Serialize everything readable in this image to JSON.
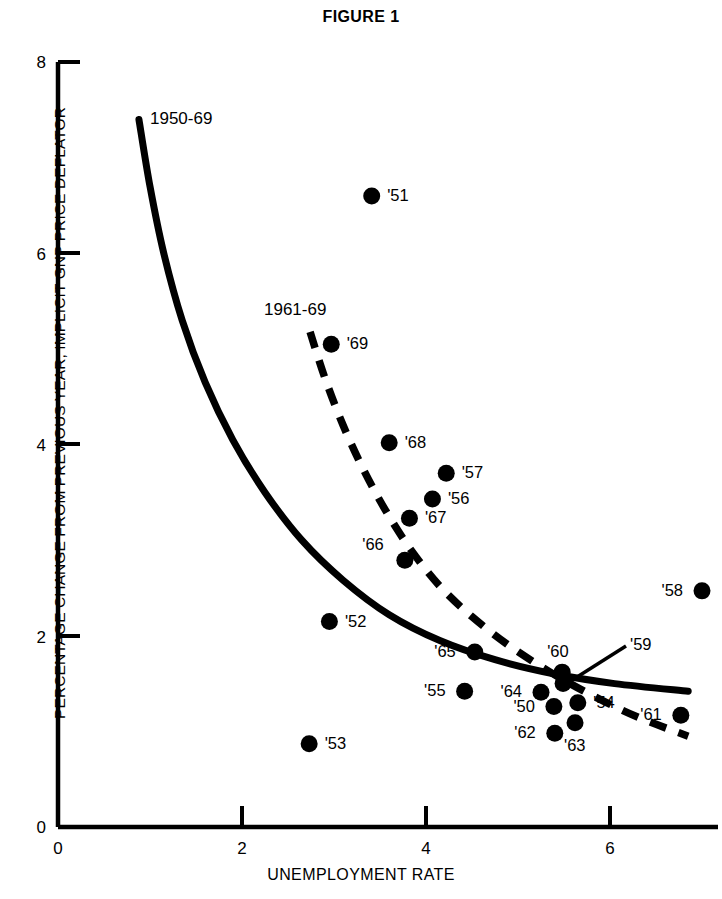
{
  "figure": {
    "title": "FIGURE 1"
  },
  "axes": {
    "xlabel": "UNEMPLOYMENT RATE",
    "ylabel": "PERCENTAGE CHANGE FROM PREVIOUS YEAR, IMPLICIT GNP PRICE DEFLATOR",
    "xticks": [
      "0",
      "2",
      "4",
      "6"
    ],
    "yticks": [
      "8",
      "6",
      "4",
      "2",
      "0"
    ]
  },
  "curves": {
    "solid_label": "1950-69",
    "dashed_label": "1961-69"
  },
  "colors": {
    "ink": "#000000",
    "background": "#ffffff"
  },
  "chart_data": {
    "type": "scatter",
    "title": "FIGURE 1",
    "xlabel": "UNEMPLOYMENT RATE",
    "ylabel": "PERCENTAGE CHANGE FROM PREVIOUS YEAR, IMPLICIT GNP PRICE DEFLATOR",
    "xlim": [
      0,
      7.2
    ],
    "ylim": [
      0,
      8
    ],
    "xticks": [
      0,
      2,
      4,
      6
    ],
    "yticks": [
      0,
      2,
      4,
      6,
      8
    ],
    "grid": false,
    "legend": "none",
    "points": [
      {
        "label": "'50",
        "x": 5.39,
        "y": 1.26,
        "label_pos": "left"
      },
      {
        "label": "'51",
        "x": 3.41,
        "y": 6.6,
        "label_pos": "right"
      },
      {
        "label": "'52",
        "x": 2.95,
        "y": 2.15,
        "label_pos": "right"
      },
      {
        "label": "'53",
        "x": 2.73,
        "y": 0.87,
        "label_pos": "right"
      },
      {
        "label": "'54",
        "x": 5.65,
        "y": 1.3,
        "label_pos": "right"
      },
      {
        "label": "'55",
        "x": 4.42,
        "y": 1.42,
        "label_pos": "left"
      },
      {
        "label": "'56",
        "x": 4.07,
        "y": 3.43,
        "label_pos": "right"
      },
      {
        "label": "'57",
        "x": 4.22,
        "y": 3.7,
        "label_pos": "right"
      },
      {
        "label": "'58",
        "x": 7.0,
        "y": 2.47,
        "label_pos": "left"
      },
      {
        "label": "'59",
        "x": 5.49,
        "y": 1.5,
        "label_pos": "leader"
      },
      {
        "label": "'60",
        "x": 5.48,
        "y": 1.62,
        "label_pos": "above"
      },
      {
        "label": "'61",
        "x": 6.77,
        "y": 1.17,
        "label_pos": "left"
      },
      {
        "label": "'62",
        "x": 5.4,
        "y": 0.98,
        "label_pos": "left"
      },
      {
        "label": "'63",
        "x": 5.62,
        "y": 1.09,
        "label_pos": "below"
      },
      {
        "label": "'64",
        "x": 5.25,
        "y": 1.41,
        "label_pos": "left"
      },
      {
        "label": "'65",
        "x": 4.53,
        "y": 1.83,
        "label_pos": "left"
      },
      {
        "label": "'66",
        "x": 3.77,
        "y": 2.79,
        "label_pos": "upper-left"
      },
      {
        "label": "'67",
        "x": 3.82,
        "y": 3.23,
        "label_pos": "right"
      },
      {
        "label": "'68",
        "x": 3.6,
        "y": 4.02,
        "label_pos": "right"
      },
      {
        "label": "'69",
        "x": 2.97,
        "y": 5.05,
        "label_pos": "right"
      }
    ],
    "series": [
      {
        "name": "1950-69",
        "style": "solid",
        "points": [
          [
            0.88,
            7.4
          ],
          [
            1.0,
            6.7
          ],
          [
            1.15,
            6.0
          ],
          [
            1.35,
            5.3
          ],
          [
            1.6,
            4.65
          ],
          [
            1.9,
            4.05
          ],
          [
            2.25,
            3.5
          ],
          [
            2.65,
            3.0
          ],
          [
            3.1,
            2.58
          ],
          [
            3.6,
            2.22
          ],
          [
            4.15,
            1.95
          ],
          [
            4.75,
            1.75
          ],
          [
            5.4,
            1.6
          ],
          [
            6.05,
            1.5
          ],
          [
            6.85,
            1.42
          ]
        ]
      },
      {
        "name": "1961-69",
        "style": "dashed",
        "points": [
          [
            2.74,
            5.18
          ],
          [
            2.9,
            4.7
          ],
          [
            3.1,
            4.2
          ],
          [
            3.33,
            3.72
          ],
          [
            3.58,
            3.28
          ],
          [
            3.85,
            2.88
          ],
          [
            4.15,
            2.52
          ],
          [
            4.5,
            2.2
          ],
          [
            4.9,
            1.9
          ],
          [
            5.35,
            1.62
          ],
          [
            5.8,
            1.38
          ],
          [
            6.3,
            1.15
          ],
          [
            6.85,
            0.95
          ]
        ]
      }
    ]
  }
}
